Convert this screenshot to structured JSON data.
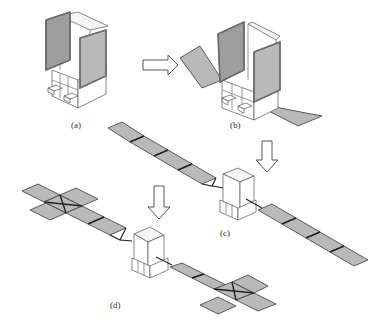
{
  "figure": {
    "stages": [
      {
        "id": "a",
        "label": "(a)",
        "state": "stowed - both wings folded against body"
      },
      {
        "id": "b",
        "label": "(b)",
        "state": "first panels unfolded"
      },
      {
        "id": "c",
        "label": "(c)",
        "state": "linear wings deployed, 4 panels per wing"
      },
      {
        "id": "d",
        "label": "(d)",
        "state": "fully deployed, cross-shaped outer panels"
      }
    ],
    "arrows": [
      {
        "from": "a",
        "to": "b",
        "direction": "right"
      },
      {
        "from": "b",
        "to": "c",
        "direction": "down"
      },
      {
        "from": "c",
        "to": "d",
        "direction": "down"
      }
    ],
    "colors": {
      "panel_fill": "#b9b9b9",
      "panel_stroke": "#3a3a3a",
      "frame": "#6b6b6b",
      "background": "#ffffff"
    }
  }
}
